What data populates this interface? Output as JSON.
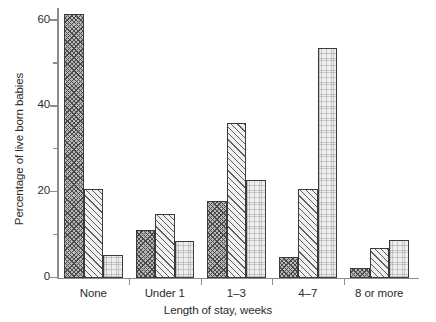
{
  "chart_data": {
    "type": "bar",
    "title": "",
    "subtitle": "",
    "xlabel": "Length of stay, weeks",
    "ylabel": "Percentage of live born babies",
    "categories": [
      "None",
      "Under 1",
      "1–3",
      "4–7",
      "8 or more"
    ],
    "series": [
      {
        "name": "series-1",
        "pattern": "cross-hatch",
        "values": [
          61.5,
          11.2,
          17.9,
          4.9,
          2.3
        ]
      },
      {
        "name": "series-2",
        "pattern": "diagonal-hatch",
        "values": [
          20.8,
          15.0,
          36.0,
          20.8,
          7.0
        ]
      },
      {
        "name": "series-3",
        "pattern": "light-stipple",
        "values": [
          5.3,
          8.6,
          22.8,
          53.6,
          8.8
        ]
      }
    ],
    "ylim": [
      0,
      63
    ],
    "y_ticks_major": [
      0,
      20,
      40,
      60
    ],
    "y_ticks_major_labels": [
      "0",
      "20",
      "40",
      "60"
    ],
    "y_ticks_minor": [
      10,
      30,
      50
    ],
    "grid": false,
    "legend_position": "none",
    "axis_color": "#8d8d8d",
    "bar_edge_color": "#3b3b3b",
    "text_color": "#2b2b2b",
    "background_color": "#ffffff"
  }
}
